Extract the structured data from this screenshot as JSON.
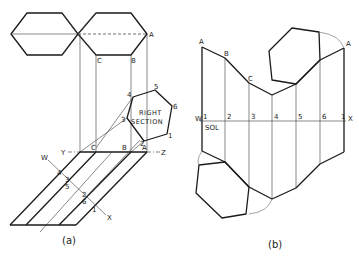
{
  "figure_a": {
    "caption": "(a)",
    "top_view_labels": {
      "A": "A",
      "B": "B",
      "C": "C"
    },
    "right_section": {
      "label_line1": "RIGHT",
      "label_line2": "SECTION",
      "vertices": [
        "1",
        "2",
        "3",
        "4",
        "5",
        "6"
      ]
    },
    "folding_line": {
      "left": "Y",
      "right": "Z",
      "points": [
        "C",
        "B",
        "A"
      ]
    },
    "cutting_line": {
      "start": "W",
      "end": "X",
      "points": [
        "4",
        "3",
        "5",
        "2",
        "6",
        "1"
      ]
    }
  },
  "figure_b": {
    "caption": "(b)",
    "top_labels": [
      "A",
      "B",
      "C",
      "A"
    ],
    "stretch_out_line": {
      "start": "W",
      "end": "X",
      "name": "SOL"
    },
    "stations": [
      "1",
      "2",
      "3",
      "4",
      "5",
      "6",
      "1"
    ]
  }
}
